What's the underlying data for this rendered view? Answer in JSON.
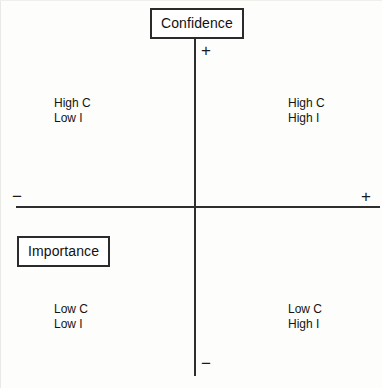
{
  "diagram": {
    "type": "quadrant",
    "background_color": "#fdfdfc",
    "line_color": "#2e2e2e",
    "text_color": "#141414"
  },
  "axes": {
    "vertical": {
      "title": "Confidence",
      "positive_sign": "+",
      "negative_sign": "−"
    },
    "horizontal": {
      "title": "Importance",
      "positive_sign": "+",
      "negative_sign": "−"
    }
  },
  "quadrants": {
    "top_left": {
      "line1": "High C",
      "line2": "Low I"
    },
    "top_right": {
      "line1": "High C",
      "line2": "High I"
    },
    "bottom_left": {
      "line1": "Low C",
      "line2": "Low I"
    },
    "bottom_right": {
      "line1": "Low C",
      "line2": "High I"
    }
  }
}
